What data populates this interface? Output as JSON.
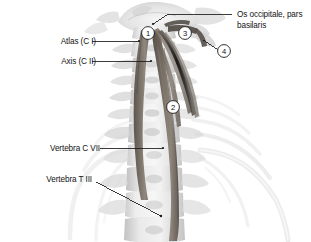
{
  "figure": {
    "background_color": "#ffffff",
    "width": 311,
    "height": 242
  },
  "labels": {
    "atlas": "Atlas (C I)",
    "axis": "Axis (C II)",
    "vertebra_cvii": "Vertebra C VII",
    "vertebra_tiii": "Vertebra T III",
    "os_occipitale": "Os occipitale, pars basilaris"
  },
  "markers": [
    {
      "id": "1",
      "number": "1",
      "x": 148,
      "y": 33
    },
    {
      "id": "2",
      "number": "2",
      "x": 173,
      "y": 107
    },
    {
      "id": "3",
      "number": "3",
      "x": 185,
      "y": 33
    },
    {
      "id": "4",
      "number": "4",
      "x": 224,
      "y": 51
    }
  ],
  "colors": {
    "bone_light": "#e6e6e6",
    "bone_mid": "#cfcfcf",
    "bone_shadow": "#b4b4b4",
    "muscle_dark": "#6a6158",
    "muscle_mid": "#857b70",
    "muscle_light": "#9c9289",
    "leader_line": "#1a1a1a",
    "text": "#131313"
  }
}
